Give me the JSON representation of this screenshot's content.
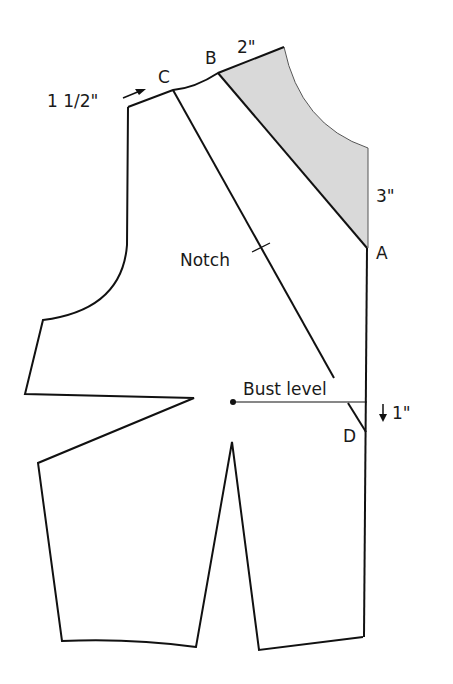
{
  "diagram": {
    "type": "bodice-pattern",
    "points": {
      "A": "A",
      "B": "B",
      "C": "C",
      "D": "D"
    },
    "measurements": {
      "shoulder_shift": "1 1/2\"",
      "neck_width": "2\"",
      "neck_depth": "3\"",
      "bust_drop": "1\""
    },
    "annotations": {
      "notch": "Notch",
      "bust_level": "Bust level"
    },
    "colors": {
      "line": "#111111",
      "shade": "#d9d9d9",
      "background": "#ffffff"
    }
  }
}
